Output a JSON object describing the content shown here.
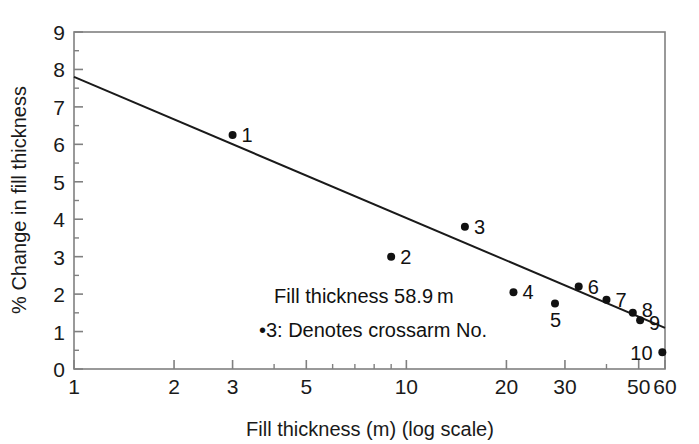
{
  "chart_data": {
    "type": "scatter",
    "title": "",
    "xlabel": "Fill thickness (m) (log scale)",
    "ylabel": "% Change in fill thickness",
    "xscale": "log",
    "xlim": [
      1,
      60
    ],
    "ylim": [
      0,
      9
    ],
    "grid": false,
    "legend": null,
    "x_ticks": [
      {
        "value": 1,
        "label": "1"
      },
      {
        "value": 2,
        "label": "2"
      },
      {
        "value": 3,
        "label": "3"
      },
      {
        "value": 5,
        "label": "5"
      },
      {
        "value": 10,
        "label": "10"
      },
      {
        "value": 20,
        "label": "20"
      },
      {
        "value": 30,
        "label": "30"
      },
      {
        "value": 50,
        "label": "50"
      },
      {
        "value": 60,
        "label": "60"
      }
    ],
    "x_minor_ticks": [
      4,
      6,
      7,
      8,
      9,
      40
    ],
    "y_ticks": [
      {
        "value": 0,
        "label": "0"
      },
      {
        "value": 1,
        "label": "1"
      },
      {
        "value": 2,
        "label": "2"
      },
      {
        "value": 3,
        "label": "3"
      },
      {
        "value": 4,
        "label": "4"
      },
      {
        "value": 5,
        "label": "5"
      },
      {
        "value": 6,
        "label": "6"
      },
      {
        "value": 7,
        "label": "7"
      },
      {
        "value": 8,
        "label": "8"
      },
      {
        "value": 9,
        "label": "9"
      }
    ],
    "y_minor_ticks": [
      0.5,
      1.5,
      2.5,
      3.5,
      4.5,
      5.5,
      6.5,
      7.5,
      8.5
    ],
    "points": [
      {
        "label": "1",
        "x": 3.0,
        "y": 6.25,
        "label_dx": 9,
        "label_dy": 7
      },
      {
        "label": "2",
        "x": 9.0,
        "y": 3.0,
        "label_dx": 9,
        "label_dy": 7
      },
      {
        "label": "3",
        "x": 15.0,
        "y": 3.8,
        "label_dx": 9,
        "label_dy": 7
      },
      {
        "label": "4",
        "x": 21.0,
        "y": 2.05,
        "label_dx": 9,
        "label_dy": 7
      },
      {
        "label": "5",
        "x": 28.0,
        "y": 1.75,
        "label_dx": -5,
        "label_dy": 24
      },
      {
        "label": "6",
        "x": 33.0,
        "y": 2.2,
        "label_dx": 9,
        "label_dy": 7
      },
      {
        "label": "7",
        "x": 40.0,
        "y": 1.85,
        "label_dx": 9,
        "label_dy": 7
      },
      {
        "label": "8",
        "x": 48.0,
        "y": 1.5,
        "label_dx": 9,
        "label_dy": 4
      },
      {
        "label": "9",
        "x": 50.5,
        "y": 1.3,
        "label_dx": 9,
        "label_dy": 10
      },
      {
        "label": "10",
        "x": 58.9,
        "y": 0.45,
        "label_dx": -32,
        "label_dy": 8
      }
    ],
    "trend_line": {
      "x_start": 1,
      "y_start": 7.8,
      "x_end": 60,
      "y_end": 1.1
    },
    "annotations": [
      {
        "text": "Fill thickness 58.9 m",
        "x": 4.0,
        "y": 1.75
      },
      {
        "text": "•3: Denotes crossarm No.",
        "x": 3.6,
        "y": 0.85
      }
    ]
  },
  "style": {
    "axis_color": "#808080",
    "line_color": "#1a1a1a",
    "point_color": "#111111",
    "text_color": "#1a1a1a",
    "background": "#ffffff"
  }
}
